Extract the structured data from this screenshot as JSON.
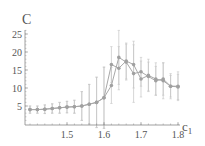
{
  "chart_data": {
    "type": "line",
    "title": "",
    "xlabel": "c",
    "xlabel_sub": "1",
    "ylabel": "C",
    "xlim": [
      1.39,
      1.8
    ],
    "ylim": [
      0,
      27
    ],
    "xticks": [
      1.5,
      1.6,
      1.7,
      1.8
    ],
    "xtick_labels": [
      "1.5",
      "1.6",
      "1.7",
      "1.8"
    ],
    "yticks": [
      5,
      10,
      15,
      20,
      25
    ],
    "ytick_labels": [
      "5",
      "10",
      "15",
      "20",
      "25"
    ],
    "grid": false,
    "legend": null,
    "x": [
      1.4,
      1.42,
      1.44,
      1.46,
      1.48,
      1.5,
      1.52,
      1.54,
      1.56,
      1.58,
      1.6,
      1.62,
      1.64,
      1.66,
      1.68,
      1.7,
      1.72,
      1.74,
      1.76,
      1.78,
      1.8
    ],
    "series": [
      {
        "name": "series-a",
        "values": [
          4.0,
          4.0,
          4.1,
          4.3,
          4.5,
          4.7,
          4.8,
          5.0,
          5.5,
          6.0,
          7.3,
          16.5,
          15.5,
          17.5,
          16.5,
          12.5,
          13.5,
          12.5,
          12.0,
          10.5,
          10.5
        ],
        "errors": [
          1.0,
          1.0,
          1.2,
          1.3,
          1.5,
          1.6,
          1.8,
          4.0,
          5.5,
          7.0,
          8.5,
          5.0,
          6.0,
          5.0,
          6.5,
          5.0,
          4.5,
          4.5,
          5.0,
          3.5,
          4.0
        ]
      },
      {
        "name": "series-b",
        "values": [
          4.0,
          4.0,
          4.1,
          4.3,
          4.5,
          4.7,
          4.8,
          5.0,
          5.5,
          6.0,
          7.3,
          10.7,
          18.5,
          17.2,
          14.0,
          14.5,
          13.2,
          12.0,
          12.5,
          10.5,
          10.3
        ],
        "errors": [
          1.0,
          1.0,
          1.2,
          1.3,
          1.5,
          1.6,
          1.8,
          4.0,
          5.5,
          7.0,
          8.5,
          5.0,
          7.5,
          5.0,
          8.0,
          4.0,
          4.0,
          4.0,
          4.5,
          3.0,
          3.5
        ]
      }
    ]
  },
  "colors": {
    "line": "#a8a8a8",
    "marker": "#a0a0a0",
    "errorbar": "#c4c4c4",
    "axis": "#888888",
    "text": "#555555"
  }
}
